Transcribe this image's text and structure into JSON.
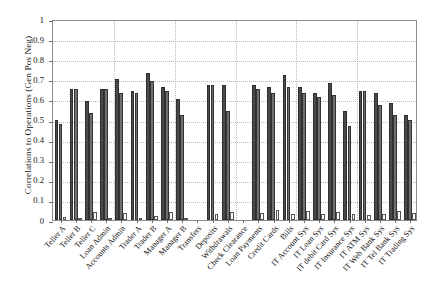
{
  "chart_data": {
    "type": "bar",
    "title": "",
    "subtitle": "",
    "xlabel": "",
    "ylabel": "Correlations to Operations (Gen Pos Neg)",
    "ylim": [
      0,
      1
    ],
    "yticks": [
      "0",
      "0.1",
      "0.2",
      "0.3",
      "0.4",
      "0.5",
      "0.6",
      "0.7",
      "0.8",
      "0.9",
      "1"
    ],
    "ytick_values": [
      0,
      0.1,
      0.2,
      0.3,
      0.4,
      0.5,
      0.6,
      0.7,
      0.8,
      0.9,
      1
    ],
    "grid": true,
    "grid_style": "dotted",
    "legend": "none",
    "legend_position": "none",
    "categories": [
      "Teller A",
      "Teller B",
      "Teller C",
      "Loan Admin",
      "Accounts Admin",
      "Trader A",
      "Trader B",
      "Manager A",
      "Manager B",
      "Transfers",
      "Deposits",
      "Withdrawals",
      "Check Clearance",
      "Loan Payments",
      "Credit Cards",
      "Bills",
      "IT Account Sys",
      "IT Loan Sys",
      "IT debit Card Sys",
      "IT Insurance Sys",
      "IT ATM Sys",
      "IT Web Bank Sys",
      "IT Tel Bank Sys",
      "IT Trading Sys"
    ],
    "series": [
      {
        "name": "Series 1",
        "color": "#4a4a4a",
        "values": [
          0.5,
          0.65,
          0.59,
          0.65,
          0.7,
          0.64,
          0.73,
          0.66,
          0.6,
          0.0,
          0.67,
          0.67,
          0.0,
          0.67,
          0.66,
          0.72,
          0.66,
          0.63,
          0.68,
          0.54,
          0.64,
          0.63,
          0.58,
          0.52
        ]
      },
      {
        "name": "Series 2",
        "color": "#6f6f6f",
        "values": [
          0.48,
          0.65,
          0.53,
          0.65,
          0.63,
          0.63,
          0.69,
          0.64,
          0.52,
          0.0,
          0.67,
          0.54,
          0.0,
          0.65,
          0.63,
          0.66,
          0.63,
          0.61,
          0.62,
          0.47,
          0.64,
          0.57,
          0.52,
          0.5
        ]
      },
      {
        "name": "Series 3",
        "color": "#fdfdfd",
        "values": [
          0.015,
          0.01,
          0.04,
          0.012,
          0.035,
          0.012,
          0.02,
          0.04,
          0.01,
          0.0,
          0.03,
          0.04,
          0.0,
          0.035,
          0.05,
          0.03,
          0.045,
          0.03,
          0.04,
          0.03,
          0.025,
          0.03,
          0.045,
          0.035
        ]
      }
    ]
  }
}
